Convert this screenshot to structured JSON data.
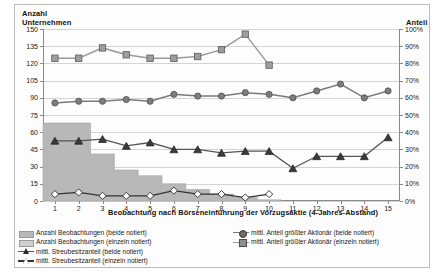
{
  "chart_data": {
    "type": "line",
    "title": "",
    "xlabel": "Beobachtung nach Börseneinführung der Vorzugsaktie (4-Jahres-Abstand)",
    "ylabel": "Anzahl Unternehmen",
    "ylabel_right": "Anteil",
    "x": [
      1,
      2,
      3,
      4,
      5,
      6,
      7,
      8,
      9,
      10,
      11,
      12,
      13,
      14,
      15
    ],
    "xlim": [
      0.5,
      15.5
    ],
    "ylim": [
      0,
      150
    ],
    "ylim_right": [
      0,
      100
    ],
    "yticks": [
      0,
      15,
      30,
      45,
      60,
      75,
      90,
      105,
      120,
      135,
      150
    ],
    "yticks_right": [
      "0%",
      "10%",
      "20%",
      "30%",
      "40%",
      "50%",
      "60%",
      "70%",
      "80%",
      "90%",
      "100%"
    ],
    "xticks": [
      "1",
      "2",
      "3",
      "4",
      "5",
      "6",
      "7",
      "8",
      "9",
      "10",
      "11",
      "12",
      "13",
      "14",
      "15"
    ],
    "grid": true,
    "legend_position": "below",
    "series": [
      {
        "name": "Anzahl Beobachtungen (beide notiert)",
        "type": "area",
        "axis": "left",
        "marker": "none",
        "color": "#b8b8b8",
        "values": [
          68,
          68,
          41,
          27,
          22,
          15,
          10,
          6,
          3,
          1,
          null,
          null,
          null,
          null,
          null
        ]
      },
      {
        "name": "Anzahl Beobachtungen (einzeln notiert)",
        "type": "area",
        "axis": "left",
        "marker": "none",
        "color": "#d0d0d0",
        "values": [
          68,
          68,
          41,
          27,
          22,
          15,
          10,
          6,
          3,
          1,
          null,
          null,
          null,
          null,
          null
        ]
      },
      {
        "name": "mittl. Streubesitzanteil (beide notiert)",
        "type": "line",
        "axis": "right",
        "marker": "triangle-filled",
        "color": "#555555",
        "values": [
          35,
          35,
          36,
          32,
          34,
          30,
          30,
          28,
          29,
          29,
          19,
          26,
          26,
          26,
          37
        ]
      },
      {
        "name": "mittl. Streubesitzanteil (einzeln notiert)",
        "type": "line",
        "axis": "right",
        "marker": "diamond-open",
        "color": "#333333",
        "values": [
          4,
          5,
          3,
          3,
          3,
          6,
          4,
          4,
          2,
          4,
          null,
          null,
          null,
          null,
          null
        ]
      },
      {
        "name": "mittl. Anteil größter Aktionär (beide notiert)",
        "type": "line",
        "axis": "right",
        "marker": "circle-filled",
        "color": "#7a7a7a",
        "values": [
          57,
          58,
          58,
          59,
          58,
          62,
          61,
          61,
          63,
          62,
          60,
          64,
          68,
          60,
          64
        ]
      },
      {
        "name": "mittl. Anteil größter Aktionär (einzeln notiert)",
        "type": "line",
        "axis": "right",
        "marker": "square-filled",
        "color": "#9a9a9a",
        "values": [
          83,
          83,
          89,
          85,
          83,
          83,
          84,
          88,
          97,
          79,
          null,
          null,
          null,
          null,
          null
        ]
      }
    ],
    "series_right_tail": {
      "note": "circle series continues to x=15",
      "values": [
        60,
        61,
        58,
        62,
        56
      ]
    }
  }
}
